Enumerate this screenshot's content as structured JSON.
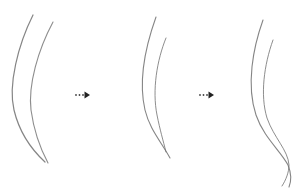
{
  "diagram": {
    "stroke_color": "#6e6e6e",
    "arrow_color": "#222222",
    "panels": [
      {
        "id": "stage-1",
        "strands": [
          "M33,15 C18,45 8,85 14,110 C20,135 32,150 45,162",
          "M53,22 C38,50 28,85 31,110 C34,132 40,148 48,163"
        ]
      },
      {
        "id": "stage-2",
        "strands": [
          "M156,17 C146,45 138,80 145,110 C150,130 160,140 170,158",
          "M166,38 C157,60 152,90 157,115 C160,130 163,140 166,152"
        ]
      },
      {
        "id": "stage-3",
        "strands": [
          "M263,20 C253,48 246,85 256,115 C264,138 280,150 288,165 C292,175 291,182 289,187",
          "M273,40 C264,65 260,95 267,118 C274,138 288,150 289,165 C289,172 286,180 282,186"
        ]
      }
    ],
    "arrows": [
      {
        "id": "arrow-1",
        "x": 75,
        "y": 95
      },
      {
        "id": "arrow-2",
        "x": 199,
        "y": 95
      }
    ]
  }
}
